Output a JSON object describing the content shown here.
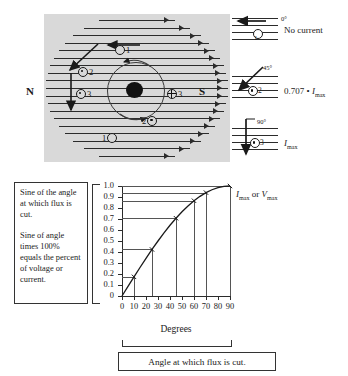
{
  "figure": {
    "poles": {
      "north": "N",
      "south": "S"
    },
    "conductor_labels": [
      "1",
      "2",
      "3",
      "3",
      "2",
      "1"
    ]
  },
  "legend": {
    "rows": [
      {
        "angle": "0°",
        "conductor": "1",
        "value": "No current"
      },
      {
        "angle": "45°",
        "conductor": "2",
        "value_prefix": "0.707 • ",
        "value_symbol": "I",
        "value_sub": "max"
      },
      {
        "angle": "90°",
        "conductor": "3",
        "value_prefix": "",
        "value_symbol": "I",
        "value_sub": "max"
      }
    ]
  },
  "description_box": {
    "paragraph_1": "Sine of the angle at which flux is cut.",
    "paragraph_2": "Sine of angle times 100% equals the percent of voltage or current."
  },
  "caption_box": {
    "text": "Angle at which flux is cut."
  },
  "plot_side_label": {
    "i_symbol": "I",
    "i_sub": "max",
    "conjunction": " or ",
    "v_symbol": "V",
    "v_sub": "max"
  },
  "chart_data": {
    "type": "line",
    "title": "",
    "xlabel": "Degrees",
    "ylabel": "",
    "xlim": [
      0,
      90
    ],
    "ylim": [
      0,
      1.0
    ],
    "grid": true,
    "legend_position": "right",
    "x_tick_labels": [
      "0",
      "10",
      "20",
      "30",
      "40",
      "50",
      "60",
      "70",
      "80",
      "90"
    ],
    "x_ticks": [
      0,
      10,
      20,
      30,
      40,
      50,
      60,
      70,
      80,
      90
    ],
    "y_tick_labels": [
      "1.0",
      "0.9",
      "0.8",
      "0.7",
      "0.6",
      "0.5",
      "0.4",
      "0.3",
      "0.2",
      "0.1",
      "0"
    ],
    "y_ticks": [
      1.0,
      0.9,
      0.8,
      0.7,
      0.6,
      0.5,
      0.4,
      0.3,
      0.2,
      0.1,
      0
    ],
    "series": [
      {
        "name": "sine",
        "x": [
          0,
          5,
          10,
          15,
          20,
          25,
          30,
          35,
          40,
          45,
          50,
          55,
          60,
          65,
          70,
          75,
          80,
          85,
          90
        ],
        "values": [
          0,
          0.087,
          0.174,
          0.259,
          0.342,
          0.423,
          0.5,
          0.574,
          0.643,
          0.707,
          0.766,
          0.819,
          0.866,
          0.906,
          0.94,
          0.966,
          0.985,
          0.996,
          1.0
        ]
      }
    ],
    "marked_points": [
      {
        "x": 10,
        "y": 0.174
      },
      {
        "x": 25,
        "y": 0.423
      },
      {
        "x": 45,
        "y": 0.707
      },
      {
        "x": 60,
        "y": 0.866
      },
      {
        "x": 70,
        "y": 0.94
      },
      {
        "x": 90,
        "y": 1.0
      }
    ]
  }
}
